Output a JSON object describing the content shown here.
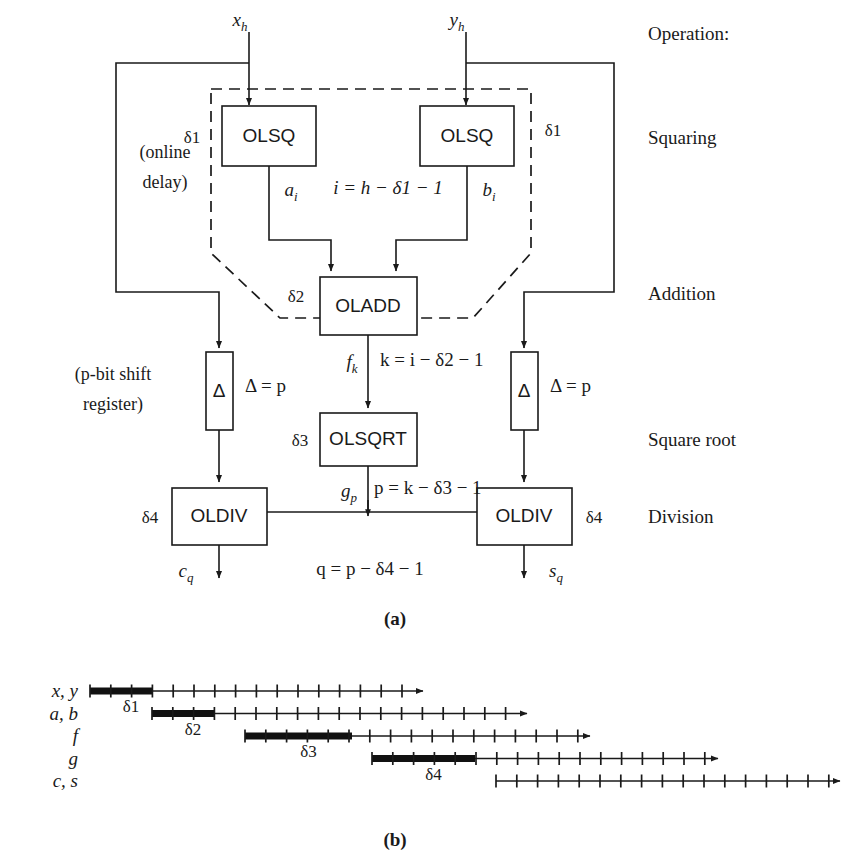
{
  "figure": {
    "caption_a": "(a)",
    "caption_b": "(b)"
  },
  "operation_column": {
    "header": "Operation:",
    "rows": [
      {
        "label": "Squaring"
      },
      {
        "label": "Addition"
      },
      {
        "label": "Square root"
      },
      {
        "label": "Division"
      }
    ]
  },
  "diagram": {
    "inputs": [
      {
        "name": "x",
        "sub": "h"
      },
      {
        "name": "y",
        "sub": "h"
      }
    ],
    "blocks": [
      {
        "id": "olsq-left",
        "label": "OLSQ"
      },
      {
        "id": "olsq-right",
        "label": "OLSQ"
      },
      {
        "id": "oladd",
        "label": "OLADD"
      },
      {
        "id": "olsqrt",
        "label": "OLSQRT"
      },
      {
        "id": "oldiv-left",
        "label": "OLDIV"
      },
      {
        "id": "oldiv-right",
        "label": "OLDIV"
      },
      {
        "id": "delta-left",
        "label": "Δ"
      },
      {
        "id": "delta-right",
        "label": "Δ"
      }
    ],
    "delays": {
      "d1_left": "δ1",
      "d1_right": "δ1",
      "d2": "δ2",
      "d3": "δ3",
      "d4_left": "δ4",
      "d4_right": "δ4"
    },
    "annotations": {
      "online_delay_line1": "(online",
      "online_delay_line2": "delay)",
      "shift_register_line1": "(p-bit shift",
      "shift_register_line2": "register)",
      "delta_eq_left": "Δ = p",
      "delta_eq_right": "Δ = p"
    },
    "signals": [
      {
        "name": "a",
        "sub": "i"
      },
      {
        "name": "b",
        "sub": "i"
      },
      {
        "name": "f",
        "sub": "k"
      },
      {
        "name": "g",
        "sub": "p"
      },
      {
        "name": "c",
        "sub": "q"
      },
      {
        "name": "s",
        "sub": "q"
      }
    ],
    "equations": [
      {
        "id": "eq-i",
        "text": "i = h − δ1 − 1"
      },
      {
        "id": "eq-k",
        "text": "k = i − δ2 − 1"
      },
      {
        "id": "eq-p",
        "text": "p = k − δ3 − 1"
      },
      {
        "id": "eq-q",
        "text": "q = p − δ4 − 1"
      }
    ]
  },
  "timeline": {
    "rows": [
      {
        "label": "x, y",
        "delay_label": "δ1",
        "start_x": 90,
        "thick_end_x": 152,
        "arrow_end_x": 423,
        "tick_spacing": 20.8,
        "tick_count": 16
      },
      {
        "label": "a, b",
        "delay_label": "δ2",
        "start_x": 152,
        "thick_end_x": 214,
        "arrow_end_x": 527,
        "tick_spacing": 20.8,
        "tick_count": 18
      },
      {
        "label": "f",
        "delay_label": "δ3",
        "start_x": 245,
        "thick_end_x": 352,
        "arrow_end_x": 590,
        "tick_spacing": 20.8,
        "tick_count": 17
      },
      {
        "label": "g",
        "delay_label": "δ4",
        "start_x": 372,
        "thick_end_x": 475,
        "arrow_end_x": 718,
        "tick_spacing": 20.8,
        "tick_count": 17
      },
      {
        "label": "c, s",
        "delay_label": "",
        "start_x": 496,
        "thick_end_x": 496,
        "arrow_end_x": 840,
        "tick_spacing": 20.8,
        "tick_count": 17
      }
    ]
  }
}
